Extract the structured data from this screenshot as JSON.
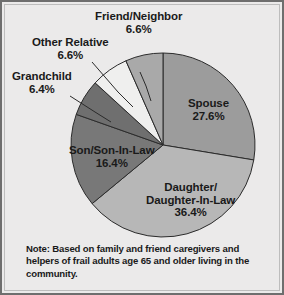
{
  "figure": {
    "background_color": "#ebeaea",
    "border_color": "#6e6e6e"
  },
  "note": {
    "text": "Note: Based on family and friend caregivers and helpers of frail adults age 65 and older living in the community."
  },
  "chart_data": {
    "type": "pie",
    "title": "",
    "subtitle": "",
    "xlabel": "",
    "ylabel": "",
    "legend_position": "none",
    "grid": false,
    "units": "percent",
    "start_angle_deg": 0,
    "direction": "clockwise",
    "center": {
      "x": 163,
      "y": 145
    },
    "radius": 92,
    "categories": [
      "Spouse",
      "Daughter/Daughter-In-Law",
      "Son/Son-In-Law",
      "Grandchild",
      "Other Relative",
      "Friend/Neighbor"
    ],
    "values": [
      27.6,
      36.4,
      16.4,
      6.4,
      6.6,
      6.6
    ],
    "colors": [
      "#9c9c9c",
      "#b7b7b7",
      "#787878",
      "#6f6f6f",
      "#efefee",
      "#a9a9a9"
    ],
    "slices": [
      {
        "label": "Spouse",
        "value": 27.6,
        "color": "#9c9c9c",
        "label_placement": "inside"
      },
      {
        "label": "Daughter/Daughter-In-Law",
        "value": 36.4,
        "color": "#b7b7b7",
        "label_placement": "inside"
      },
      {
        "label": "Son/Son-In-Law",
        "value": 16.4,
        "color": "#787878",
        "label_placement": "inside"
      },
      {
        "label": "Grandchild",
        "value": 6.4,
        "color": "#6f6f6f",
        "label_placement": "outside"
      },
      {
        "label": "Other Relative",
        "value": 6.6,
        "color": "#efefee",
        "label_placement": "outside"
      },
      {
        "label": "Friend/Neighbor",
        "value": 6.6,
        "color": "#a9a9a9",
        "label_placement": "outside"
      }
    ]
  },
  "labels": {
    "friend": {
      "name": "Friend/Neighbor",
      "pct": "6.6%"
    },
    "other": {
      "name": "Other Relative",
      "pct": "6.6%"
    },
    "grand": {
      "name": "Grandchild",
      "pct": "6.4%"
    },
    "spouse": {
      "name": "Spouse",
      "pct": "27.6%"
    },
    "son": {
      "name": "Son/Son-In-Law",
      "pct": "16.4%"
    },
    "daughter": {
      "name1": "Daughter/",
      "name2": "Daughter-In-Law",
      "pct": "36.4%"
    }
  }
}
